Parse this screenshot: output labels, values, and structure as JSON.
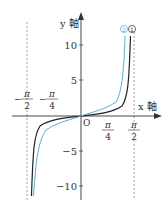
{
  "diagram": {
    "axes": {
      "x_label": "x 軸",
      "y_label": "y 軸",
      "origin_label": "O"
    },
    "y_ticks": [
      {
        "value": 10,
        "label": "10"
      },
      {
        "value": 5,
        "label": "5"
      },
      {
        "value": -5,
        "label": "−5"
      },
      {
        "value": -10,
        "label": "−10"
      }
    ],
    "x_ticks": [
      {
        "value": "-π/2",
        "num": "π",
        "den": "2",
        "sign": "−"
      },
      {
        "value": "-π/4",
        "num": "π",
        "den": "4",
        "sign": "−"
      },
      {
        "value": "π/4",
        "num": "π",
        "den": "4",
        "sign": ""
      },
      {
        "value": "π/2",
        "num": "π",
        "den": "2",
        "sign": ""
      }
    ],
    "curves": [
      {
        "id": "curve-1",
        "label": "①",
        "color": "#222222"
      },
      {
        "id": "curve-2",
        "label": "②",
        "color": "#5aaed6"
      }
    ],
    "asymptotes": [
      "x = -π/2",
      "x = π/2"
    ]
  }
}
